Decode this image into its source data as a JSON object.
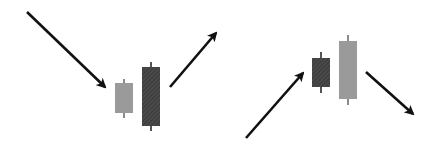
{
  "diagram": {
    "background": "#ffffff",
    "colors": {
      "arrow": "#111111",
      "light_candle": "#9a9a9a",
      "dark_candle": "#4a4a4a",
      "wick_light": "#8a8a8a",
      "wick_dark": "#555555"
    },
    "patterns": [
      {
        "name": "bullish-engulfing",
        "arrows": [
          {
            "direction": "down-right",
            "x1": 27,
            "y1": 12,
            "x2": 105,
            "y2": 87
          },
          {
            "direction": "up-right",
            "x1": 170,
            "y1": 87,
            "x2": 216,
            "y2": 33
          }
        ],
        "candles": [
          {
            "style": "light",
            "x": 115,
            "w": 18,
            "body_top": 83,
            "body_bottom": 113,
            "wick_top": 79,
            "wick_bottom": 118
          },
          {
            "style": "dark-hatched",
            "x": 142,
            "w": 18,
            "body_top": 67,
            "body_bottom": 126,
            "wick_top": 62,
            "wick_bottom": 131
          }
        ]
      },
      {
        "name": "bearish-engulfing",
        "arrows": [
          {
            "direction": "up-right",
            "x1": 246,
            "y1": 138,
            "x2": 303,
            "y2": 73
          },
          {
            "direction": "down-right",
            "x1": 366,
            "y1": 72,
            "x2": 413,
            "y2": 114
          }
        ],
        "candles": [
          {
            "style": "dark-hatched",
            "x": 312,
            "w": 18,
            "body_top": 58,
            "body_bottom": 87,
            "wick_top": 52,
            "wick_bottom": 93
          },
          {
            "style": "light",
            "x": 339,
            "w": 18,
            "body_top": 41,
            "body_bottom": 99,
            "wick_top": 35,
            "wick_bottom": 105
          }
        ]
      }
    ]
  }
}
